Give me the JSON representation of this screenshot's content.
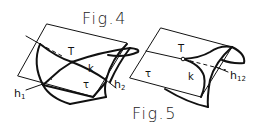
{
  "figures": [
    {
      "id": "fig4",
      "caption": "Fig.4",
      "labels": {
        "point": "T",
        "curve": "k",
        "plane": "τ",
        "line_left": "h",
        "line_left_sub": "1",
        "line_right": "h",
        "line_right_sub": "2"
      }
    },
    {
      "id": "fig5",
      "caption": "Fig.5",
      "labels": {
        "point": "T",
        "curve": "k",
        "plane": "τ",
        "line": "h",
        "line_sub": "12"
      }
    }
  ],
  "colors": {
    "ink": "#111111",
    "background": "#ffffff"
  }
}
